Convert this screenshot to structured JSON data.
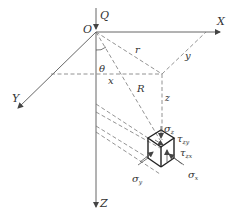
{
  "diagram": {
    "type": "3d-coordinate-stress-element",
    "labels": {
      "load": "Q",
      "origin": "O",
      "x_axis": "X",
      "y_axis": "Y",
      "z_axis": "Z",
      "angle": "θ",
      "radial": "r",
      "distance": "R",
      "x_coord": "x",
      "y_coord": "y",
      "z_coord": "z",
      "sigma_z": "σ",
      "sigma_z_sub": "z",
      "sigma_y": "σ",
      "sigma_y_sub": "y",
      "sigma_x": "σ",
      "sigma_x_sub": "x",
      "tau_zx": "τ",
      "tau_zx_sub": "zx",
      "tau_yz": "τ",
      "tau_yz_sub": "zy"
    },
    "colors": {
      "line": "#555555",
      "cube": "#222222",
      "text": "#333333"
    }
  }
}
